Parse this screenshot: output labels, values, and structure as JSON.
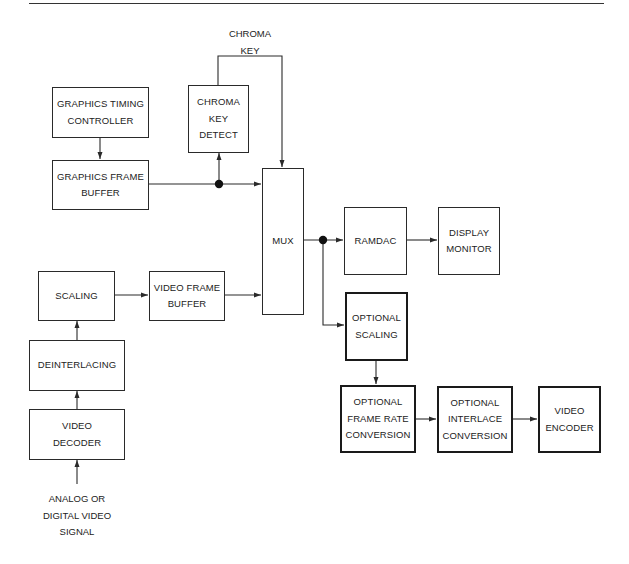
{
  "figure": {
    "top_rule": true,
    "colors": {
      "line": "#2a2a2a",
      "background": "#ffffff",
      "text": "#222222"
    }
  },
  "blocks": {
    "graphics_timing_controller": {
      "lines": [
        "GRAPHICS TIMING",
        "CONTROLLER"
      ],
      "emphasis": false
    },
    "graphics_frame_buffer": {
      "lines": [
        "GRAPHICS FRAME",
        "BUFFER"
      ],
      "emphasis": false
    },
    "chroma_key_detect": {
      "lines": [
        "CHROMA",
        "KEY",
        "DETECT"
      ],
      "emphasis": false
    },
    "mux": {
      "lines": [
        "MUX"
      ],
      "emphasis": false
    },
    "ramdac": {
      "lines": [
        "RAMDAC"
      ],
      "emphasis": false
    },
    "display_monitor": {
      "lines": [
        "DISPLAY",
        "MONITOR"
      ],
      "emphasis": false
    },
    "scaling": {
      "lines": [
        "SCALING"
      ],
      "emphasis": false
    },
    "video_frame_buffer": {
      "lines": [
        "VIDEO FRAME",
        "BUFFER"
      ],
      "emphasis": false
    },
    "deinterlacing": {
      "lines": [
        "DEINTERLACING"
      ],
      "emphasis": false
    },
    "video_decoder": {
      "lines": [
        "VIDEO",
        "DECODER"
      ],
      "emphasis": false
    },
    "optional_scaling": {
      "lines": [
        "OPTIONAL",
        "SCALING"
      ],
      "emphasis": true
    },
    "optional_frame_rate_conversion": {
      "lines": [
        "OPTIONAL",
        "FRAME RATE",
        "CONVERSION"
      ],
      "emphasis": true
    },
    "optional_interlace_conversion": {
      "lines": [
        "OPTIONAL",
        "INTERLACE",
        "CONVERSION"
      ],
      "emphasis": true
    },
    "video_encoder": {
      "lines": [
        "VIDEO",
        "ENCODER"
      ],
      "emphasis": true
    }
  },
  "labels": {
    "chroma_key_signal": {
      "lines": [
        "CHROMA",
        "KEY"
      ]
    },
    "video_input": {
      "lines": [
        "ANALOG OR",
        "DIGITAL VIDEO",
        "SIGNAL"
      ]
    }
  },
  "connections": [
    {
      "from": "graphics_timing_controller",
      "to": "graphics_frame_buffer"
    },
    {
      "from": "graphics_frame_buffer",
      "to": "mux",
      "via_junction": "junction_graphics"
    },
    {
      "from": "junction_graphics",
      "to": "chroma_key_detect"
    },
    {
      "from": "chroma_key_detect",
      "to": "mux",
      "label": "chroma_key_signal"
    },
    {
      "from": "video_input",
      "to": "video_decoder"
    },
    {
      "from": "video_decoder",
      "to": "deinterlacing"
    },
    {
      "from": "deinterlacing",
      "to": "scaling"
    },
    {
      "from": "scaling",
      "to": "video_frame_buffer"
    },
    {
      "from": "video_frame_buffer",
      "to": "mux"
    },
    {
      "from": "mux",
      "to": "ramdac",
      "via_junction": "junction_output"
    },
    {
      "from": "ramdac",
      "to": "display_monitor"
    },
    {
      "from": "junction_output",
      "to": "optional_scaling"
    },
    {
      "from": "optional_scaling",
      "to": "optional_frame_rate_conversion"
    },
    {
      "from": "optional_frame_rate_conversion",
      "to": "optional_interlace_conversion"
    },
    {
      "from": "optional_interlace_conversion",
      "to": "video_encoder"
    }
  ]
}
